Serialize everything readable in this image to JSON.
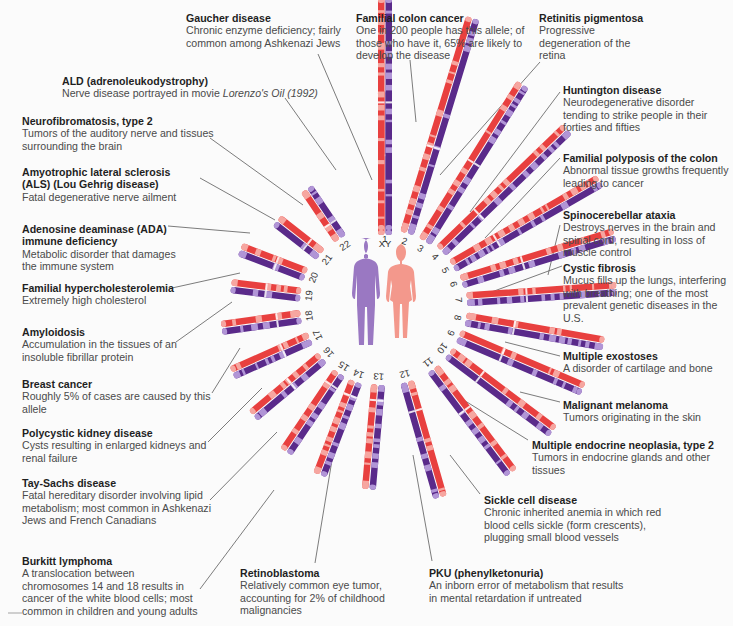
{
  "figure": {
    "center": {
      "x": 385,
      "y": 305
    },
    "colors": {
      "male_body": "#9a78c2",
      "female_body": "#f3988c",
      "red": "#e8403f",
      "red_light": "#f6a6a0",
      "purple": "#5a2a8a",
      "purple_light": "#b195d6",
      "leader_line": "#5b5b5b"
    },
    "figures": [
      {
        "name": "male",
        "label": "male-figure"
      },
      {
        "name": "female",
        "label": "female-figure"
      }
    ],
    "chromosomes": [
      {
        "id": "XY",
        "angle": -90,
        "inner": 70,
        "length": 145,
        "order_left": "red",
        "split": 0.55
      },
      {
        "id": "1",
        "angle": -90,
        "inner": 75,
        "length": 232,
        "order_left": "red",
        "split": 0.55
      },
      {
        "id": "2",
        "angle": -73,
        "inner": 75,
        "length": 225,
        "order_left": "red",
        "split": 0.4
      },
      {
        "id": "3",
        "angle": -58,
        "inner": 75,
        "length": 185,
        "order_left": "red",
        "split": 0.5
      },
      {
        "id": "4",
        "angle": -44,
        "inner": 78,
        "length": 175,
        "order_left": "red",
        "split": 0.3
      },
      {
        "id": "5",
        "angle": -30,
        "inner": 78,
        "length": 170,
        "order_left": "red",
        "split": 0.3
      },
      {
        "id": "6",
        "angle": -17,
        "inner": 80,
        "length": 160,
        "order_left": "red",
        "split": 0.4
      },
      {
        "id": "7",
        "angle": -4,
        "inner": 82,
        "length": 150,
        "order_left": "red",
        "split": 0.4
      },
      {
        "id": "8",
        "angle": 10,
        "inner": 82,
        "length": 140,
        "order_left": "red",
        "split": 0.35
      },
      {
        "id": "9",
        "angle": 23,
        "inner": 80,
        "length": 135,
        "order_left": "red",
        "split": 0.35
      },
      {
        "id": "10",
        "angle": 37,
        "inner": 80,
        "length": 130,
        "order_left": "red",
        "split": 0.3
      },
      {
        "id": "11",
        "angle": 53,
        "inner": 80,
        "length": 130,
        "order_left": "red",
        "split": 0.4
      },
      {
        "id": "12",
        "angle": 74,
        "inner": 80,
        "length": 120,
        "order_left": "red",
        "split": 0.25
      },
      {
        "id": "13",
        "angle": 95,
        "inner": 80,
        "length": 105,
        "order_left": "purple",
        "split": 0.15
      },
      {
        "id": "14",
        "angle": 111,
        "inner": 82,
        "length": 100,
        "order_left": "purple",
        "split": 0.15
      },
      {
        "id": "15",
        "angle": 124,
        "inner": 82,
        "length": 95,
        "order_left": "purple",
        "split": 0.15
      },
      {
        "id": "16",
        "angle": 140,
        "inner": 82,
        "length": 90,
        "order_left": "purple",
        "split": 0.45
      },
      {
        "id": "17",
        "angle": 156,
        "inner": 82,
        "length": 85,
        "order_left": "purple",
        "split": 0.35
      },
      {
        "id": "18",
        "angle": 172,
        "inner": 85,
        "length": 80,
        "order_left": "purple",
        "split": 0.3
      },
      {
        "id": "19",
        "angle": 187,
        "inner": 85,
        "length": 70,
        "order_left": "purple",
        "split": 0.5
      },
      {
        "id": "20",
        "angle": 201,
        "inner": 85,
        "length": 70,
        "order_left": "purple",
        "split": 0.45
      },
      {
        "id": "21",
        "angle": 218,
        "inner": 82,
        "length": 55,
        "order_left": "purple",
        "split": 0.3
      },
      {
        "id": "22",
        "angle": 236,
        "inner": 80,
        "length": 60,
        "order_left": "red",
        "split": 0.3
      }
    ]
  },
  "labels": [
    {
      "key": "gaucher",
      "title": "Gaucher disease",
      "desc": "Chronic enzyme deficiency; fairly common among Ashkenazi Jews",
      "x": 186,
      "y": 12,
      "w": 160,
      "chromosome": "1",
      "line": [
        [
          318,
          54
        ],
        [
          372,
          180
        ]
      ]
    },
    {
      "key": "colon-cancer",
      "title": "Familial colon cancer",
      "desc": "One in 200 people has this allele; of those who have it, 65% are likely to develop the disease",
      "x": 356,
      "y": 12,
      "w": 176,
      "chromosome": "2",
      "line": [
        [
          410,
          60
        ],
        [
          416,
          122
        ]
      ]
    },
    {
      "key": "retinitis",
      "title": "Retinitis pigmentosa",
      "desc": "Progressive degeneration of the retina",
      "x": 539,
      "y": 12,
      "w": 120,
      "chromosome": "3",
      "line": [
        [
          540,
          62
        ],
        [
          440,
          175
        ]
      ]
    },
    {
      "key": "ald",
      "title": "ALD (adrenoleukodystrophy)",
      "desc": "Nerve disease portrayed in movie",
      "desc_italic": "Lorenzo's Oil (1992)",
      "x": 62,
      "y": 75,
      "w": 300,
      "chromosome": "XY",
      "line": [
        [
          285,
          98
        ],
        [
          336,
          170
        ]
      ]
    },
    {
      "key": "nf2",
      "title": "Neurofibromatosis, type 2",
      "desc": "Tumors of the auditory nerve and tissues surrounding the brain",
      "x": 22,
      "y": 115,
      "w": 200,
      "chromosome": "22",
      "line": [
        [
          210,
          138
        ],
        [
          303,
          205
        ]
      ]
    },
    {
      "key": "huntington",
      "title": "Huntington disease",
      "desc": "Neurodegenerative disorder tending to strike people in their forties and fifties",
      "x": 563,
      "y": 84,
      "w": 165,
      "chromosome": "4",
      "line": [
        [
          560,
          92
        ],
        [
          470,
          212
        ]
      ]
    },
    {
      "key": "polyposis",
      "title": "Familial polyposis of the colon",
      "desc": "Abnormal tissue growths frequently leading to cancer",
      "x": 563,
      "y": 152,
      "w": 170,
      "chromosome": "5",
      "line": [
        [
          560,
          158
        ],
        [
          485,
          238
        ]
      ]
    },
    {
      "key": "als",
      "title": "Amyotrophic lateral sclerosis (ALS) (Lou Gehrig disease)",
      "desc": "Fatal degenerative nerve ailment",
      "x": 22,
      "y": 166,
      "w": 175,
      "chromosome": "21",
      "line": [
        [
          200,
          178
        ],
        [
          275,
          220
        ]
      ]
    },
    {
      "key": "sca",
      "title": "Spinocerebellar ataxia",
      "desc": "Destroys nerves in the brain and spinal cord, resulting in loss of muscle control",
      "x": 563,
      "y": 209,
      "w": 170,
      "chromosome": "6",
      "line": [
        [
          560,
          225
        ],
        [
          548,
          275
        ]
      ]
    },
    {
      "key": "ada",
      "title": "Adenosine deaminase (ADA) immune deficiency",
      "desc": "Metabolic disorder that damages the immune system",
      "x": 22,
      "y": 223,
      "w": 160,
      "chromosome": "20",
      "line": [
        [
          168,
          226
        ],
        [
          250,
          233
        ]
      ]
    },
    {
      "key": "fh",
      "title": "Familial hypercholesterolemia",
      "desc": "Extremely high cholesterol",
      "x": 22,
      "y": 282,
      "w": 160,
      "chromosome": "19",
      "line": [
        [
          172,
          288
        ],
        [
          240,
          273
        ]
      ]
    },
    {
      "key": "cf",
      "title": "Cystic fibrosis",
      "desc": "Mucus fills up the lungs, interfering with breathing; one of the most prevalent genetic diseases in the U.S.",
      "x": 563,
      "y": 262,
      "w": 170,
      "chromosome": "7",
      "line": [
        [
          562,
          266
        ],
        [
          478,
          297
        ]
      ]
    },
    {
      "key": "amyloidosis",
      "title": "Amyloidosis",
      "desc": "Accumulation in the tissues of an insoluble fibrillar protein",
      "x": 22,
      "y": 326,
      "w": 160,
      "chromosome": "18",
      "line": [
        [
          176,
          342
        ],
        [
          232,
          302
        ]
      ]
    },
    {
      "key": "exostoses",
      "title": "Multiple exostoses",
      "desc": "A disorder of cartilage and bone",
      "x": 563,
      "y": 350,
      "w": 170,
      "chromosome": "8",
      "line": [
        [
          560,
          356
        ],
        [
          505,
          342
        ]
      ]
    },
    {
      "key": "breast-cancer",
      "title": "Breast cancer",
      "desc": "Roughly 5% of cases are caused by this allele",
      "x": 22,
      "y": 378,
      "w": 190,
      "chromosome": "17",
      "line": [
        [
          212,
          393
        ],
        [
          240,
          348
        ]
      ]
    },
    {
      "key": "melanoma",
      "title": "Malignant melanoma",
      "desc": "Tumors originating in the skin",
      "x": 563,
      "y": 399,
      "w": 170,
      "chromosome": "9",
      "line": [
        [
          560,
          402
        ],
        [
          520,
          392
        ]
      ]
    },
    {
      "key": "pkd",
      "title": "Polycystic kidney disease",
      "desc": "Cysts resulting in enlarged kidneys and renal failure",
      "x": 22,
      "y": 427,
      "w": 195,
      "chromosome": "16",
      "line": [
        [
          208,
          442
        ],
        [
          262,
          388
        ]
      ]
    },
    {
      "key": "men2",
      "title": "Multiple endocrine neoplasia, type 2",
      "desc": "Tumors in endocrine glands and other tissues",
      "x": 532,
      "y": 439,
      "w": 200,
      "chromosome": "10",
      "line": [
        [
          528,
          440
        ],
        [
          462,
          399
        ]
      ]
    },
    {
      "key": "tay-sachs",
      "title": "Tay-Sachs disease",
      "desc": "Fatal hereditary disorder involving lipid metabolism; most common in Ashkenazi Jews and French Canadians",
      "x": 22,
      "y": 477,
      "w": 195,
      "chromosome": "15",
      "line": [
        [
          210,
          500
        ],
        [
          277,
          432
        ]
      ]
    },
    {
      "key": "sickle-cell",
      "title": "Sickle cell disease",
      "desc": "Chronic inherited anemia in which red blood cells sickle (form crescents), plugging small blood vessels",
      "x": 484,
      "y": 494,
      "w": 185,
      "chromosome": "11",
      "line": [
        [
          480,
          494
        ],
        [
          450,
          455
        ]
      ]
    },
    {
      "key": "burkitt",
      "title": "Burkitt lymphoma",
      "desc": "A translocation between chromosomes 14 and 18 results in cancer of the white blood cells; most common in children and young adults",
      "x": 22,
      "y": 555,
      "w": 180,
      "chromosome": "14",
      "line": [
        [
          200,
          589
        ],
        [
          274,
          490
        ]
      ]
    },
    {
      "key": "retinoblastoma",
      "title": "Retinoblastoma",
      "desc": "Relatively common eye tumor, accounting for 2% of childhood malignancies",
      "x": 240,
      "y": 567,
      "w": 160,
      "chromosome": "13",
      "line": [
        [
          315,
          563
        ],
        [
          332,
          460
        ]
      ]
    },
    {
      "key": "pku",
      "title": "PKU (phenylketonuria)",
      "desc": "An inborn error of metabolism that results in mental retardation if untreated",
      "x": 429,
      "y": 567,
      "w": 200,
      "chromosome": "12",
      "line": [
        [
          432,
          561
        ],
        [
          413,
          455
        ]
      ]
    }
  ]
}
